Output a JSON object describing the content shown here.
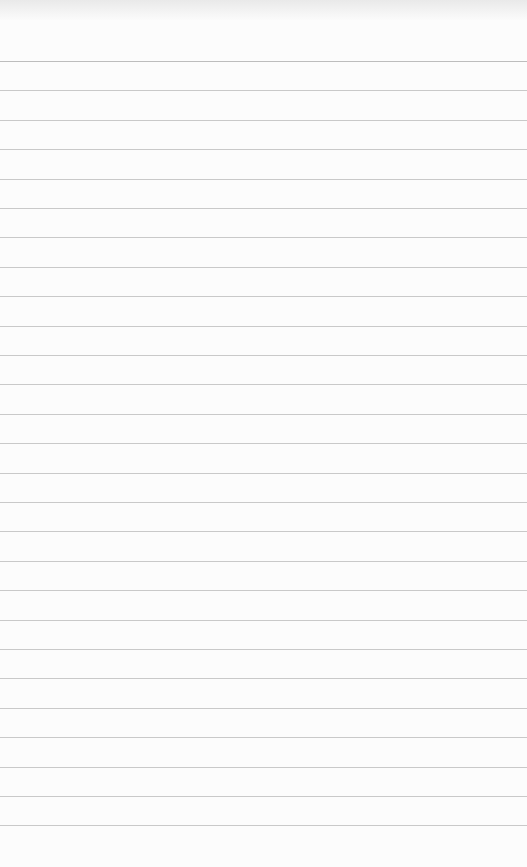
{
  "notepad": {
    "paper_color": "#fcfcfc",
    "line_color": "#c9c9c9",
    "first_line_y": 61,
    "line_spacing": 29.4,
    "line_count": 27
  }
}
